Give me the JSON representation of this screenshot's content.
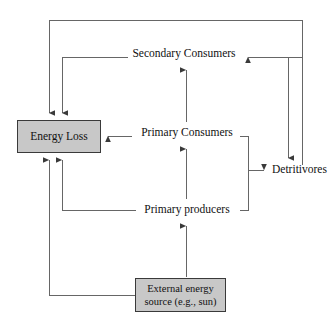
{
  "diagram": {
    "type": "flow-diagram",
    "background_color": "#ffffff",
    "line_color": "#555555",
    "box_fill_color": "#c8c8c8",
    "box_border_color": "#3a3a3a",
    "text_color": "#111111",
    "nodes": {
      "energy_loss": {
        "label": "Energy Loss",
        "shape": "box"
      },
      "secondary_consumers": {
        "label": "Secondary Consumers",
        "shape": "text"
      },
      "primary_consumers": {
        "label": "Primary Consumers",
        "shape": "text"
      },
      "primary_producers": {
        "label": "Primary producers",
        "shape": "text"
      },
      "detritivores": {
        "label": "Detritivores",
        "shape": "text"
      },
      "external_source": {
        "label_line1": "External energy",
        "label_line2": "source (e.g., sun)",
        "shape": "box"
      }
    },
    "edges": [
      {
        "from": "secondary_consumers",
        "to": "energy_loss",
        "style": "orthogonal",
        "arrow": "down"
      },
      {
        "from": "detritivores_loop",
        "to": "energy_loss",
        "style": "orthogonal",
        "arrow": "down"
      },
      {
        "from": "primary_consumers",
        "to": "energy_loss",
        "style": "straight",
        "arrow": "left"
      },
      {
        "from": "primary_producers",
        "to": "energy_loss",
        "style": "orthogonal",
        "arrow": "up"
      },
      {
        "from": "external_source",
        "to": "energy_loss",
        "style": "orthogonal",
        "arrow": "up"
      },
      {
        "from": "primary_consumers",
        "to": "secondary_consumers",
        "style": "straight",
        "arrow": "up"
      },
      {
        "from": "primary_producers",
        "to": "primary_consumers",
        "style": "straight",
        "arrow": "up"
      },
      {
        "from": "external_source",
        "to": "primary_producers",
        "style": "straight",
        "arrow": "up"
      },
      {
        "from": "primary_consumers",
        "to": "detritivores",
        "style": "orthogonal",
        "arrow": "right"
      },
      {
        "from": "primary_producers",
        "to": "detritivores",
        "style": "orthogonal",
        "arrow": "right"
      },
      {
        "from": "detritivores",
        "to": "secondary_consumers",
        "style": "orthogonal",
        "arrow": "left"
      },
      {
        "from": "detritivores",
        "to": "detritivores_sink",
        "style": "orthogonal",
        "arrow": "down"
      }
    ]
  }
}
